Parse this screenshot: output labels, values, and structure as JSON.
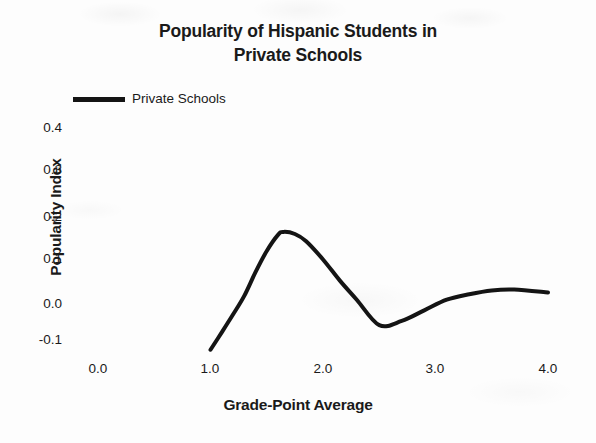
{
  "chart_data": {
    "type": "line",
    "title": "Popularity of Hispanic Students in Private Schools",
    "title_line1": "Popularity of Hispanic Students in",
    "title_line2": "Private Schools",
    "xlabel": "Grade-Point Average",
    "ylabel": "Popularity Index",
    "xlim": [
      0.0,
      4.0
    ],
    "ylim": [
      -0.1,
      0.4
    ],
    "xticks": [
      "0.0",
      "1.0",
      "2.0",
      "3.0",
      "4.0"
    ],
    "yticks": [
      "0.4",
      "0.3",
      "0.2",
      "0.1",
      "0.0",
      "-0.1"
    ],
    "grid": false,
    "legend_position": "top-left",
    "legend": [
      "Private Schools"
    ],
    "line_color": "#141414",
    "line_width_px": 4,
    "series": [
      {
        "name": "Private Schools",
        "x": [
          1.0,
          1.1,
          1.2,
          1.3,
          1.4,
          1.5,
          1.6,
          1.65,
          1.75,
          1.85,
          2.0,
          2.15,
          2.3,
          2.5,
          2.7,
          2.9,
          3.1,
          3.3,
          3.5,
          3.7,
          4.0
        ],
        "values": [
          -0.123,
          -0.082,
          -0.04,
          0.004,
          0.06,
          0.11,
          0.148,
          0.155,
          0.15,
          0.133,
          0.09,
          0.04,
          -0.005,
          -0.065,
          -0.055,
          -0.03,
          -0.005,
          0.008,
          0.017,
          0.019,
          0.012
        ]
      }
    ],
    "annotations": {
      "peak": {
        "x": 1.65,
        "y": 0.155
      },
      "trough": {
        "x": 2.5,
        "y": -0.065
      },
      "start": {
        "x": 1.0,
        "y": -0.123
      },
      "end": {
        "x": 4.0,
        "y": 0.012
      }
    }
  },
  "axes": {
    "yticks": [
      {
        "label": "0.4",
        "px": 121
      },
      {
        "label": "0.3",
        "px": 163
      },
      {
        "label": "0.2",
        "px": 210
      },
      {
        "label": "0.1",
        "px": 252
      },
      {
        "label": "0.0",
        "px": 297
      },
      {
        "label": "-0.1",
        "px": 333
      }
    ],
    "xticks": [
      {
        "label": "0.0",
        "px": 98
      },
      {
        "label": "1.0",
        "px": 210
      },
      {
        "label": "2.0",
        "px": 323
      },
      {
        "label": "3.0",
        "px": 435
      },
      {
        "label": "4.0",
        "px": 548
      }
    ]
  },
  "legend": {
    "label": "Private Schools"
  }
}
